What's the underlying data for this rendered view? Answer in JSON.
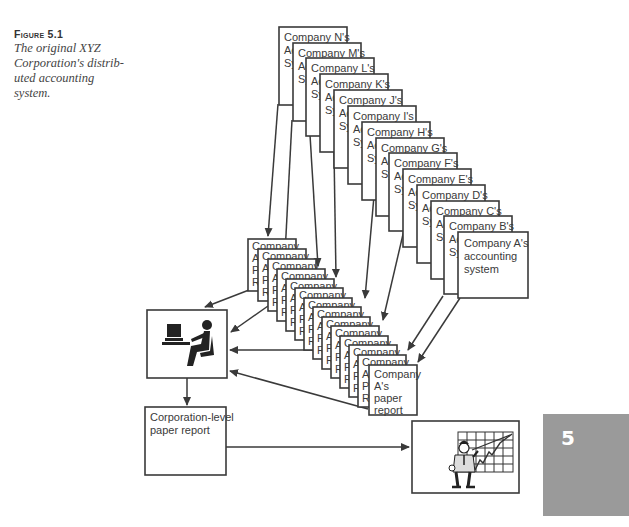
{
  "figure": {
    "label": "Figure 5.1",
    "caption_lines": [
      "The original XYZ",
      "Corporation's distrib-",
      "uted accounting",
      "system."
    ]
  },
  "accounting_systems": [
    {
      "company": "N",
      "title": "Company N's",
      "line2": "Accounting",
      "line3": "System"
    },
    {
      "company": "M",
      "title": "Company M's",
      "line2": "Accounting",
      "line3": "System"
    },
    {
      "company": "L",
      "title": "Company L's",
      "line2": "Accounting",
      "line3": "System"
    },
    {
      "company": "K",
      "title": "Company K's",
      "line2": "Accounting",
      "line3": "System"
    },
    {
      "company": "J",
      "title": "Company J's",
      "line2": "Accounting",
      "line3": "System"
    },
    {
      "company": "I",
      "title": "Company I's",
      "line2": "Accounting",
      "line3": "System"
    },
    {
      "company": "H",
      "title": "Company H's",
      "line2": "Accounting",
      "line3": "System"
    },
    {
      "company": "G",
      "title": "Company G's",
      "line2": "Accounting",
      "line3": "System"
    },
    {
      "company": "F",
      "title": "Company F's",
      "line2": "Accounting",
      "line3": "System"
    },
    {
      "company": "E",
      "title": "Company E's",
      "line2": "Accounting",
      "line3": "System"
    },
    {
      "company": "D",
      "title": "Company D's",
      "line2": "Accounting",
      "line3": "System"
    },
    {
      "company": "C",
      "title": "Company C's",
      "line2": "Accounting",
      "line3": "System"
    },
    {
      "company": "B",
      "title": "Company B's",
      "line2": "Accounting",
      "line3": "System"
    },
    {
      "company": "A",
      "title": "Company A's",
      "line2": "accounting",
      "line3": "system"
    }
  ],
  "paper_reports": [
    {
      "company": "N",
      "line1": "Company",
      "line2": "A",
      "line3": "P",
      "line4": "R"
    },
    {
      "company": "M",
      "line1": "Company",
      "line2": "A",
      "line3": "P",
      "line4": "R"
    },
    {
      "company": "L",
      "line1": "Company",
      "line2": "A",
      "line3": "P",
      "line4": "R"
    },
    {
      "company": "K",
      "line1": "Company",
      "line2": "A",
      "line3": "P",
      "line4": "R"
    },
    {
      "company": "J",
      "line1": "Company",
      "line2": "A",
      "line3": "P",
      "line4": "R"
    },
    {
      "company": "I",
      "line1": "Company",
      "line2": "A",
      "line3": "P",
      "line4": "R"
    },
    {
      "company": "H",
      "line1": "Company",
      "line2": "A",
      "line3": "P",
      "line4": "R"
    },
    {
      "company": "G",
      "line1": "Company",
      "line2": "A",
      "line3": "P",
      "line4": "R"
    },
    {
      "company": "F",
      "line1": "Company",
      "line2": "A",
      "line3": "P",
      "line4": "R"
    },
    {
      "company": "E",
      "line1": "Company",
      "line2": "A",
      "line3": "P",
      "line4": "R"
    },
    {
      "company": "D",
      "line1": "Company",
      "line2": "A",
      "line3": "P",
      "line4": "R"
    },
    {
      "company": "C",
      "line1": "Company",
      "line2": "A",
      "line3": "P",
      "line4": "R"
    },
    {
      "company": "B",
      "line1": "Company",
      "line2": "A",
      "line3": "P",
      "line4": "R"
    },
    {
      "company": "A",
      "line1": "Company",
      "line2": "A's",
      "line3": "paper",
      "line4": "report"
    }
  ],
  "nodes": {
    "data_entry": {
      "icon": "person-at-computer-icon"
    },
    "corporate_report": {
      "line1": "Corporation-level",
      "line2": "paper report"
    },
    "executive": {
      "icon": "presenter-with-chart-icon"
    }
  },
  "chapter_tab": {
    "number": "5",
    "color": "#9a9a9a"
  }
}
